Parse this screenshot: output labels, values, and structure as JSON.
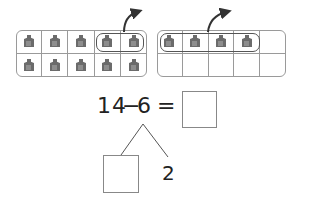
{
  "ten_frames": [
    {
      "name": "left-ten-frame",
      "filled_cells": 10,
      "circled_cells": [
        4,
        5
      ],
      "rows": 2,
      "cols": 5
    },
    {
      "name": "right-ten-frame",
      "filled_cells": 4,
      "circled_cells": [
        1,
        2,
        3,
        4
      ],
      "rows": 2,
      "cols": 5
    }
  ],
  "equation": {
    "minuend": "14",
    "operator": "−",
    "subtrahend": "6",
    "equals": "=",
    "answer": ""
  },
  "decomposition": {
    "left_part": "",
    "right_part": "2"
  },
  "colors": {
    "cube": "#6b6b6b",
    "cube_light": "#8e8e8e",
    "frame_border": "#9a9a9a",
    "arrow": "#333333"
  }
}
